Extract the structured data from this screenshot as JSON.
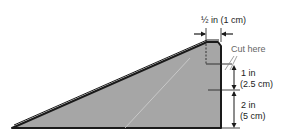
{
  "diagram": {
    "top_width_label": "½ in (1 cm)",
    "cut_label": "Cut here",
    "upper_height_label_1": "1 in",
    "upper_height_label_2": "(2.5 cm)",
    "lower_height_label_1": "2 in",
    "lower_height_label_2": "(5 cm)",
    "colors": {
      "fill": "#a6a6a6",
      "outline": "#1a1a1a",
      "cut_line": "#888888"
    }
  }
}
